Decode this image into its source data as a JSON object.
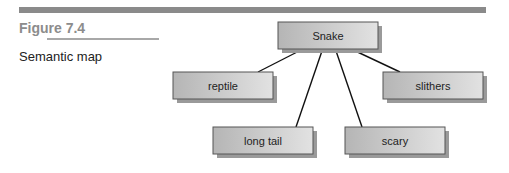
{
  "figure": {
    "number": "Figure 7.4",
    "caption": "Semantic map"
  },
  "diagram": {
    "type": "semantic-map",
    "central_node": "Snake",
    "nodes": [
      {
        "id": "snake",
        "label": "Snake"
      },
      {
        "id": "reptile",
        "label": "reptile"
      },
      {
        "id": "slithers",
        "label": "slithers"
      },
      {
        "id": "long-tail",
        "label": "long tail"
      },
      {
        "id": "scary",
        "label": "scary"
      }
    ],
    "edges": [
      {
        "from": "snake",
        "to": "reptile"
      },
      {
        "from": "snake",
        "to": "long-tail"
      },
      {
        "from": "snake",
        "to": "scary"
      },
      {
        "from": "snake",
        "to": "slithers"
      }
    ]
  }
}
